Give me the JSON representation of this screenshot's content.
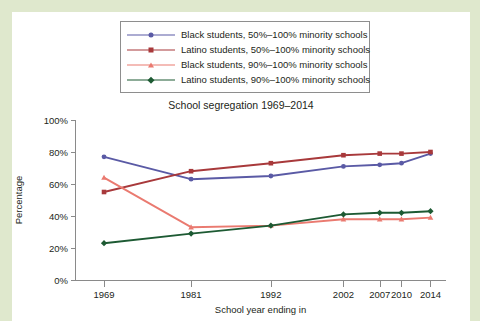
{
  "figure": {
    "background_color": "#dfe8cd",
    "card_color": "#ffffff",
    "axis_color": "#8a8a8a"
  },
  "legend": {
    "position": "top-center",
    "border_color": "#8e8e8e",
    "entries": [
      {
        "label": "Black students, 50%–100% minority schools",
        "color": "#5a5aa5",
        "marker": "dot"
      },
      {
        "label": "Latino students, 50%–100% minority schools",
        "color": "#a8393b",
        "marker": "square"
      },
      {
        "label": "Black students, 90%–100% minority schools",
        "color": "#ea7a70",
        "marker": "triangle"
      },
      {
        "label": "Latino students, 90%–100% minority schools",
        "color": "#1d5a33",
        "marker": "diamond"
      }
    ]
  },
  "chart_data": {
    "type": "line",
    "title": "School segregation 1969–2014",
    "xlabel": "School year ending in",
    "ylabel": "Percentage",
    "categories": [
      1969,
      1981,
      1992,
      2002,
      2007,
      2010,
      2014
    ],
    "xlim": [
      1965,
      2016
    ],
    "ylim": [
      0,
      100
    ],
    "yticks": [
      0,
      20,
      40,
      60,
      80,
      100
    ],
    "ytick_labels": [
      "0%",
      "20%",
      "40%",
      "60%",
      "80%",
      "100%"
    ],
    "xtick_labels": [
      "1969",
      "1981",
      "1992",
      "2002",
      "2007",
      "2010",
      "2014"
    ],
    "grid": false,
    "legend_position": "top-center",
    "series": [
      {
        "name": "Black students, 50%–100% minority schools",
        "color": "#5a5aa5",
        "marker": "dot",
        "values": [
          77,
          63,
          65,
          71,
          72,
          73,
          79
        ]
      },
      {
        "name": "Latino students, 50%–100% minority schools",
        "color": "#a8393b",
        "marker": "square",
        "values": [
          55,
          68,
          73,
          78,
          79,
          79,
          80
        ]
      },
      {
        "name": "Black students, 90%–100% minority schools",
        "color": "#ea7a70",
        "marker": "triangle",
        "values": [
          64,
          33,
          34,
          38,
          38,
          38,
          39
        ]
      },
      {
        "name": "Latino students, 90%–100% minority schools",
        "color": "#1d5a33",
        "marker": "diamond",
        "values": [
          23,
          29,
          34,
          41,
          42,
          42,
          43
        ]
      }
    ]
  }
}
